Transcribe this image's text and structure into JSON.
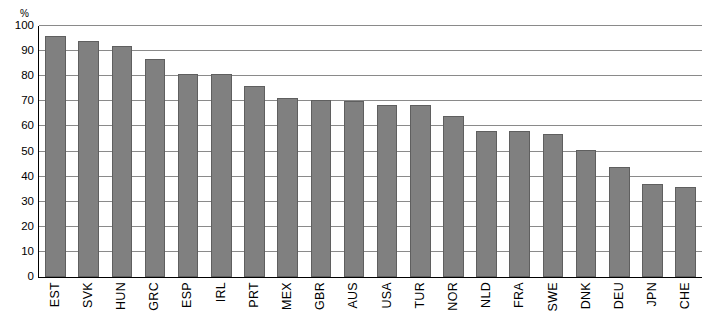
{
  "chart_data": {
    "type": "bar",
    "title": "",
    "unit": "%",
    "xlabel": "",
    "ylabel": "",
    "ylim": [
      0,
      100
    ],
    "yticks": [
      0,
      10,
      20,
      30,
      40,
      50,
      60,
      70,
      80,
      90,
      100
    ],
    "grid": true,
    "legend": "none",
    "bar_color": "#808080",
    "categories": [
      "EST",
      "SVK",
      "HUN",
      "GRC",
      "ESP",
      "IRL",
      "PRT",
      "MEX",
      "GBR",
      "AUS",
      "USA",
      "TUR",
      "NOR",
      "NLD",
      "FRA",
      "SWE",
      "DNK",
      "DEU",
      "JPN",
      "CHE"
    ],
    "values": [
      96,
      94,
      92,
      87,
      81,
      81,
      76,
      71.5,
      70.5,
      70,
      68.5,
      68.5,
      64,
      58,
      58,
      57,
      50.5,
      44,
      37,
      36
    ]
  }
}
